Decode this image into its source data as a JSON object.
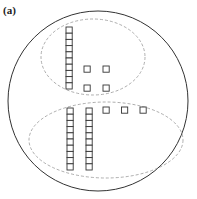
{
  "figure": {
    "label": "(a)",
    "groups": [
      {
        "name": "upper-group",
        "columns_of_ten": 1,
        "single_units": 4,
        "total": 14
      },
      {
        "name": "lower-group",
        "columns_of_ten": 2,
        "single_units": 3,
        "total": 23
      }
    ],
    "colors": {
      "outline": "#333333",
      "dashed": "#999999",
      "square": "#333333"
    }
  }
}
